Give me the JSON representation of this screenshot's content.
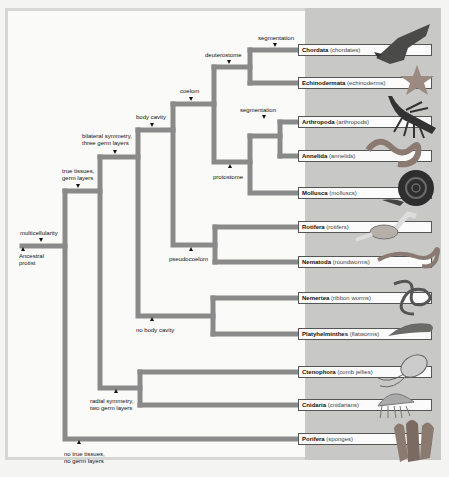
{
  "diagram": {
    "type": "phylogenetic-tree",
    "root": {
      "label_line1": "Ancestral",
      "label_line2": "protist"
    },
    "characters": {
      "multicellularity": "multicellularity",
      "true_tissues_1": "true tissues,",
      "true_tissues_2": "germ layers",
      "no_true_tissues_1": "no true tissues,",
      "no_true_tissues_2": "no germ layers",
      "bilateral_1": "bilateral symmetry,",
      "bilateral_2": "three germ layers",
      "radial_1": "radial symmetry,",
      "radial_2": "two germ layers",
      "body_cavity": "body cavity",
      "no_body_cavity": "no body cavity",
      "coelom": "coelom",
      "pseudocoelom": "pseudocoelom",
      "deuterostome": "deuterostome",
      "protostome": "protostome",
      "segmentation_deut": "segmentation",
      "segmentation_prot": "segmentation"
    },
    "taxa": [
      {
        "name": "Chordata",
        "common": "(chordates)",
        "image": "eagle"
      },
      {
        "name": "Echinodermata",
        "common": "(echinoderms)",
        "image": "starfish"
      },
      {
        "name": "Arthropoda",
        "common": "(arthropods)",
        "image": "lobster"
      },
      {
        "name": "Annelida",
        "common": "(annelids)",
        "image": "earthworm"
      },
      {
        "name": "Mollusca",
        "common": "(molluscs)",
        "image": "snail"
      },
      {
        "name": "Rotifera",
        "common": "(rotifers)",
        "image": "rotifer"
      },
      {
        "name": "Nematoda",
        "common": "(roundworms)",
        "image": "roundworm"
      },
      {
        "name": "Nemertea",
        "common": "(ribbon worms)",
        "image": "ribbon-worm"
      },
      {
        "name": "Platyhelminthes",
        "common": "(flatworms)",
        "image": "flatworm"
      },
      {
        "name": "Ctenophora",
        "common": "(comb jellies)",
        "image": "comb-jelly"
      },
      {
        "name": "Cnidaria",
        "common": "(cnidarians)",
        "image": "jellyfish"
      },
      {
        "name": "Porifera",
        "common": "(sponges)",
        "image": "sponge"
      }
    ],
    "colors": {
      "branch": "#8a8a8a",
      "panel": "#c8c8c6",
      "box_border": "#555555",
      "background": "#fafaf8"
    }
  }
}
